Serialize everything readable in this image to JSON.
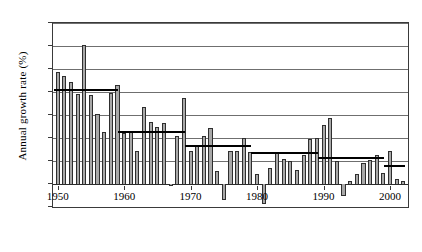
{
  "chart_data": {
    "type": "bar",
    "title": "",
    "xlabel": "",
    "ylabel": "Annual growth rate (%)",
    "ylim": [
      -2,
      14
    ],
    "ytick_step": 2,
    "yticks": [
      -2,
      0,
      2,
      4,
      6,
      8,
      10,
      12,
      14
    ],
    "xticks": [
      1950,
      1960,
      1970,
      1980,
      1990,
      2000
    ],
    "xlim": [
      1949.3,
      2002.7
    ],
    "grid": true,
    "legend": null,
    "bar_fill_color": "#a8a8a8",
    "bar_edge_color": "#2e2e2e",
    "average_line_color": "#000000",
    "categories": [
      1950,
      1951,
      1952,
      1953,
      1954,
      1955,
      1956,
      1957,
      1958,
      1959,
      1960,
      1961,
      1962,
      1963,
      1964,
      1965,
      1966,
      1967,
      1968,
      1969,
      1970,
      1971,
      1972,
      1973,
      1974,
      1975,
      1976,
      1977,
      1978,
      1979,
      1980,
      1981,
      1982,
      1983,
      1984,
      1985,
      1986,
      1987,
      1988,
      1989,
      1990,
      1991,
      1992,
      1993,
      1994,
      1995,
      1996,
      1997,
      1998,
      1999,
      2000,
      2001,
      2002
    ],
    "values": [
      9.7,
      9.4,
      8.9,
      7.8,
      12.1,
      7.7,
      6.1,
      4.5,
      7.9,
      8.6,
      4.4,
      4.6,
      2.9,
      6.7,
      5.4,
      5.0,
      5.3,
      -0.2,
      4.2,
      7.5,
      2.9,
      3.4,
      4.2,
      4.9,
      1.1,
      -1.4,
      2.9,
      2.9,
      4.0,
      2.8,
      0.9,
      -1.7,
      1.4,
      2.8,
      2.2,
      2.0,
      1.2,
      2.5,
      3.9,
      4.0,
      5.1,
      5.7,
      2.0,
      -1.0,
      0.3,
      0.9,
      1.8,
      2.1,
      2.5,
      1.0,
      2.9,
      0.4,
      0.3
    ],
    "series": [
      {
        "name": "Annual growth rate",
        "values": [
          9.7,
          9.4,
          8.9,
          7.8,
          12.1,
          7.7,
          6.1,
          4.5,
          7.9,
          8.6,
          4.4,
          4.6,
          2.9,
          6.7,
          5.4,
          5.0,
          5.3,
          -0.2,
          4.2,
          7.5,
          2.9,
          3.4,
          4.2,
          4.9,
          1.1,
          -1.4,
          2.9,
          2.9,
          4.0,
          2.8,
          0.9,
          -1.7,
          1.4,
          2.8,
          2.2,
          2.0,
          1.2,
          2.5,
          3.9,
          4.0,
          5.1,
          5.7,
          2.0,
          -1.0,
          0.3,
          0.9,
          1.8,
          2.1,
          2.5,
          1.0,
          2.9,
          0.4,
          0.3
        ]
      }
    ],
    "average_segments": [
      {
        "label": "1950-1959 average",
        "start_year": 1950,
        "end_year": 1959.6,
        "value": 8.2
      },
      {
        "label": "1960-1969 average",
        "start_year": 1959.6,
        "end_year": 1969.6,
        "value": 4.5
      },
      {
        "label": "1970-1979 average",
        "start_year": 1969.6,
        "end_year": 1979.6,
        "value": 3.3
      },
      {
        "label": "1980-1989 average",
        "start_year": 1979.6,
        "end_year": 1989.6,
        "value": 2.7
      },
      {
        "label": "1990-1999 average",
        "start_year": 1989.6,
        "end_year": 1999.6,
        "value": 2.3
      },
      {
        "label": "2000-2002 average",
        "start_year": 1999.6,
        "end_year": 2002.7,
        "value": 1.6
      }
    ]
  },
  "axis": {
    "y_title": "Annual growth rate (%)",
    "y_tick_labels": [
      "14",
      "12",
      "10",
      "8",
      "6",
      "4",
      "2",
      "0",
      "-2"
    ],
    "x_tick_labels": [
      "1950",
      "1960",
      "1970",
      "1980",
      "1990",
      "2000"
    ]
  }
}
